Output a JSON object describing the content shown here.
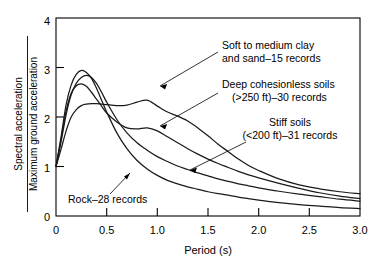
{
  "chart_data": {
    "type": "line",
    "title": "",
    "subtitle": "",
    "xlabel": "Period (s)",
    "ylabel_numerator": "Spectral acceleration",
    "ylabel_denominator": "Maximum ground acceleration",
    "xlim": [
      0,
      3.0
    ],
    "ylim": [
      0,
      4
    ],
    "xticks": [
      "0",
      "0.5",
      "1.0",
      "1.5",
      "2.0",
      "2.5",
      "3.0"
    ],
    "xtick_values": [
      0,
      0.5,
      1.0,
      1.5,
      2.0,
      2.5,
      3.0
    ],
    "yticks": [
      "0",
      "1",
      "2",
      "3",
      "4"
    ],
    "ytick_values": [
      0,
      1,
      2,
      3,
      4
    ],
    "grid": false,
    "legend": "annotations with leader lines",
    "x": [
      0.0,
      0.05,
      0.1,
      0.15,
      0.2,
      0.25,
      0.3,
      0.35,
      0.4,
      0.45,
      0.5,
      0.6,
      0.7,
      0.8,
      0.9,
      1.0,
      1.1,
      1.2,
      1.3,
      1.4,
      1.5,
      1.6,
      1.7,
      1.8,
      1.9,
      2.0,
      2.2,
      2.4,
      2.6,
      2.8,
      3.0
    ],
    "series": [
      {
        "name": "Soft to medium clay and sand-15 records",
        "label": "Soft to medium clay and sand–15 records",
        "records": 15,
        "values": [
          1.0,
          1.35,
          1.72,
          2.0,
          2.15,
          2.23,
          2.26,
          2.27,
          2.27,
          2.26,
          2.25,
          2.23,
          2.24,
          2.3,
          2.34,
          2.22,
          2.1,
          2.02,
          1.92,
          1.78,
          1.62,
          1.45,
          1.3,
          1.15,
          1.02,
          0.92,
          0.75,
          0.63,
          0.55,
          0.49,
          0.45
        ]
      },
      {
        "name": "Deep cohesionless soils (>250 ft)-30 records",
        "label": "Deep cohesionless soils (>250 ft)–30 records",
        "records": 30,
        "values": [
          1.0,
          1.55,
          2.12,
          2.48,
          2.63,
          2.67,
          2.62,
          2.5,
          2.36,
          2.22,
          2.08,
          1.9,
          1.78,
          1.76,
          1.78,
          1.72,
          1.6,
          1.48,
          1.36,
          1.25,
          1.15,
          1.06,
          0.98,
          0.9,
          0.83,
          0.77,
          0.66,
          0.56,
          0.47,
          0.4,
          0.35
        ]
      },
      {
        "name": "Stiff soils (<200 ft)-31 records",
        "label": "Stiff soils (<200 ft)–31 records",
        "records": 31,
        "values": [
          1.0,
          1.5,
          2.05,
          2.45,
          2.68,
          2.8,
          2.84,
          2.8,
          2.68,
          2.5,
          2.3,
          1.95,
          1.68,
          1.48,
          1.33,
          1.2,
          1.1,
          1.01,
          0.94,
          0.87,
          0.81,
          0.75,
          0.7,
          0.65,
          0.61,
          0.57,
          0.5,
          0.44,
          0.39,
          0.34,
          0.3
        ]
      },
      {
        "name": "Rock-28 records",
        "label": "Rock–28 records",
        "records": 28,
        "values": [
          1.0,
          1.6,
          2.25,
          2.65,
          2.86,
          2.94,
          2.9,
          2.78,
          2.58,
          2.34,
          2.1,
          1.68,
          1.36,
          1.12,
          0.95,
          0.82,
          0.72,
          0.65,
          0.59,
          0.54,
          0.49,
          0.45,
          0.42,
          0.38,
          0.35,
          0.32,
          0.27,
          0.23,
          0.2,
          0.17,
          0.15
        ]
      }
    ],
    "annotations": [
      {
        "id": "soft-clay",
        "line1": "Soft to medium clay",
        "line2": "and sand–15 records"
      },
      {
        "id": "deep-cohesionless",
        "line1": "Deep cohesionless soils",
        "line2": "(>250 ft)–30 records"
      },
      {
        "id": "stiff-soils",
        "line1": "Stiff soils",
        "line2": "(<200 ft)–31 records"
      },
      {
        "id": "rock",
        "line1": "Rock–28 records",
        "line2": ""
      }
    ],
    "colors": {
      "curve": "#1a1a1a",
      "axis": "#000000",
      "background": "#ffffff"
    }
  }
}
